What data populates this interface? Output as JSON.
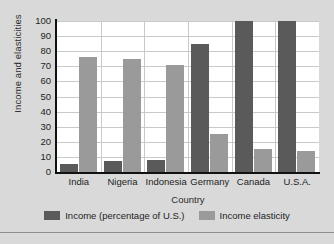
{
  "chart_data": {
    "type": "bar",
    "title": "",
    "xlabel": "Country",
    "ylabel": "Income and elasticities",
    "categories": [
      "India",
      "Nigeria",
      "Indonesia",
      "Germany",
      "Canada",
      "U.S.A."
    ],
    "series": [
      {
        "name": "Income (percentage of U.S.)",
        "color": "#5a5a5a",
        "values": [
          5,
          7,
          8,
          85,
          100,
          100
        ]
      },
      {
        "name": "Income elasticity",
        "color": "#9a9a9a",
        "values": [
          76,
          75,
          71,
          25,
          15,
          14
        ]
      }
    ],
    "ylim": [
      0,
      100
    ],
    "yticks": [
      0,
      10,
      20,
      30,
      40,
      50,
      60,
      70,
      80,
      90,
      100
    ],
    "grid": true,
    "legend_position": "bottom"
  },
  "figure": {
    "background_color": "#d9d9d9",
    "plot_background_color": "#ffffff",
    "grid_color": "#c9c9c9",
    "axis_color": "#111111"
  }
}
